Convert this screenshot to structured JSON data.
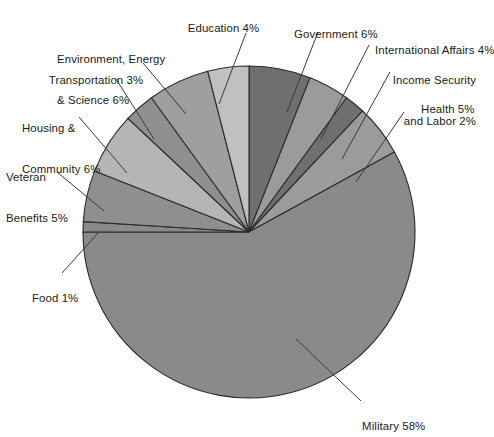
{
  "chart_data": {
    "type": "pie",
    "title": "",
    "subtitle": "",
    "xlabel": "",
    "ylabel": "",
    "legend_position": "none",
    "grid": false,
    "units": "percent",
    "total": 100,
    "start_angle_deg": 0,
    "direction": "clockwise",
    "categories": [
      "Government",
      "International Affairs",
      "Income Security and Labor",
      "Health",
      "Military",
      "Food",
      "Veteran Benefits",
      "Housing & Community",
      "Transportation",
      "Environment, Energy & Science",
      "Education"
    ],
    "values": [
      6,
      4,
      2,
      5,
      58,
      1,
      5,
      6,
      3,
      6,
      4
    ],
    "colors": [
      "#6f6f6f",
      "#9b9b9b",
      "#6f6f6f",
      "#9b9b9b",
      "#8a8a8a",
      "#8a8a8a",
      "#8f8f8f",
      "#b5b5b5",
      "#8f8f8f",
      "#9f9f9f",
      "#c0c0c0"
    ],
    "slices": [
      {
        "label": "Government 6%",
        "name": "Government",
        "value": 6,
        "color": "#6f6f6f"
      },
      {
        "label": "International Affairs 4%",
        "name": "International Affairs",
        "value": 4,
        "color": "#9b9b9b"
      },
      {
        "label": "Income Security and Labor 2%",
        "name": "Income Security and Labor",
        "value": 2,
        "color": "#6f6f6f"
      },
      {
        "label": "Health 5%",
        "name": "Health",
        "value": 5,
        "color": "#9b9b9b"
      },
      {
        "label": "Military 58%",
        "name": "Military",
        "value": 58,
        "color": "#8a8a8a"
      },
      {
        "label": "Food 1%",
        "name": "Food",
        "value": 1,
        "color": "#8a8a8a"
      },
      {
        "label": "Veteran Benefits 5%",
        "name": "Veteran Benefits",
        "value": 5,
        "color": "#8f8f8f"
      },
      {
        "label": "Housing & Community 6%",
        "name": "Housing & Community",
        "value": 6,
        "color": "#b5b5b5"
      },
      {
        "label": "Transportation 3%",
        "name": "Transportation",
        "value": 3,
        "color": "#8f8f8f"
      },
      {
        "label": "Environment, Energy & Science 6%",
        "name": "Environment, Energy & Science",
        "value": 6,
        "color": "#9f9f9f"
      },
      {
        "label": "Education 4%",
        "name": "Education",
        "value": 4,
        "color": "#c0c0c0"
      }
    ]
  },
  "labels": {
    "education": "Education 4%",
    "government": "Government 6%",
    "international": "International Affairs 4%",
    "income_line1": "Income Security",
    "income_line2": "and Labor 2%",
    "health": "Health 5%",
    "military": "Military 58%",
    "food": "Food 1%",
    "veteran_line1": "Veteran",
    "veteran_line2": "Benefits 5%",
    "housing_line1": "Housing &",
    "housing_line2": "Community 6%",
    "transportation": "Transportation 3%",
    "environment_line1": "Environment, Energy",
    "environment_line2": "& Science 6%"
  },
  "style": {
    "background": "#ffffff",
    "slice_outline": "#2b2b2b",
    "leader_line": "#3a3a3a",
    "text_color": "#1a1a1a"
  }
}
